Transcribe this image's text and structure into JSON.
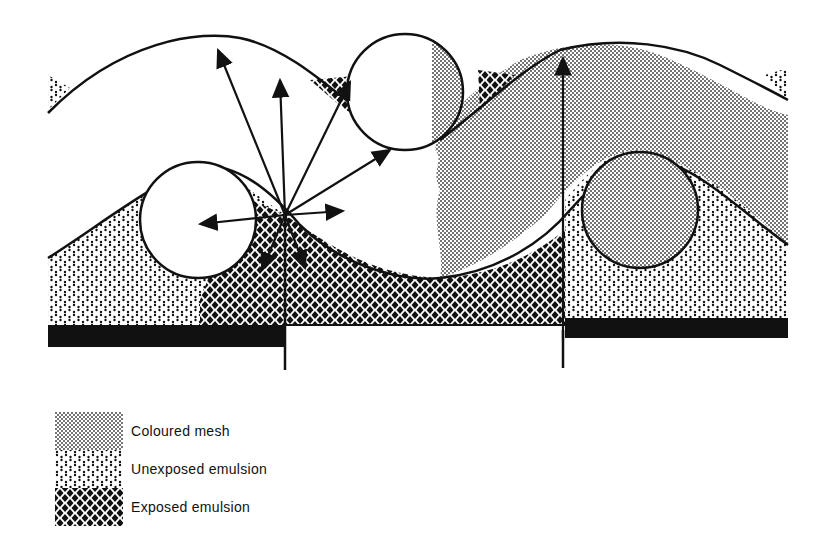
{
  "diagram": {
    "elements": {
      "threads": [
        {
          "id": "thread-left-lower",
          "fill": "white"
        },
        {
          "id": "thread-middle-upper",
          "fill": "white-and-coloured"
        },
        {
          "id": "thread-right-lower",
          "fill": "coloured"
        }
      ],
      "arrows": "light scatter from exposure point",
      "substrate_bars": [
        "left",
        "right"
      ]
    },
    "colors": {
      "ink": "#111111",
      "mesh_dot": "#333333",
      "background": "#ffffff"
    }
  },
  "legend": {
    "items": [
      {
        "label": "Coloured mesh",
        "pattern": "coloured-mesh"
      },
      {
        "label": "Unexposed emulsion",
        "pattern": "unexposed-emulsion"
      },
      {
        "label": "Exposed emulsion",
        "pattern": "exposed-emulsion"
      }
    ]
  }
}
